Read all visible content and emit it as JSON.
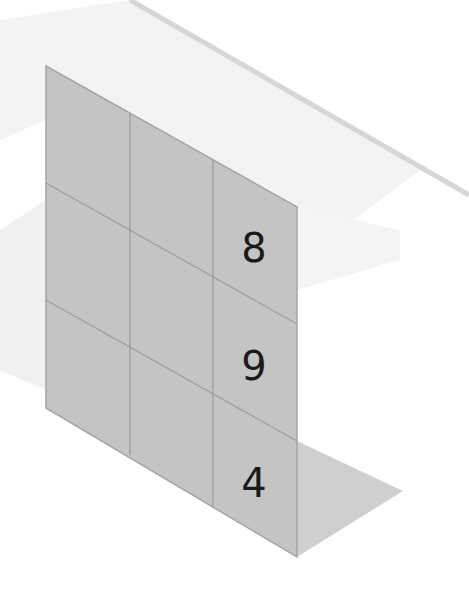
{
  "scene": {
    "description": "Isometric 3x3 grid panel standing on a floor, with numbers in the right column",
    "colors": {
      "background": "#ffffff",
      "panel_fill": "#c6c6c6",
      "grid_line": "#9a9a9a",
      "floor_shadow": "#d2d2d2",
      "ghost_shadow": "#f1f1f1",
      "stripe": "#d9d9d9",
      "digit": "#1a1a1a"
    }
  },
  "grid": {
    "rows": 3,
    "cols": 3,
    "cells": [
      [
        "",
        "",
        "8"
      ],
      [
        "",
        "",
        "9"
      ],
      [
        "",
        "",
        "4"
      ]
    ]
  }
}
